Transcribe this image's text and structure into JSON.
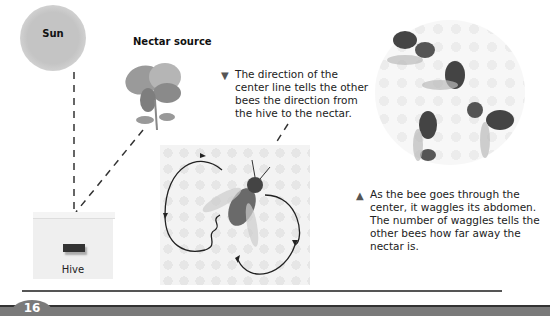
{
  "labels": {
    "sun": "Sun",
    "nectar_source": "Nectar source",
    "hive": "Hive"
  },
  "captions": {
    "direction": {
      "marker": "▼",
      "text": "The direction of the center line tells the other bees the direction from the hive to the nectar."
    },
    "waggle": {
      "marker": "▲",
      "text": "As the bee goes through the center, it waggles its abdomen. The number of waggles tells the other bees how far away the nectar is."
    }
  },
  "footer": {
    "page_number": "16"
  },
  "colors": {
    "footer_bar": "#7a7a7a",
    "rule": "#555555",
    "sun": "#c4c4c4"
  }
}
